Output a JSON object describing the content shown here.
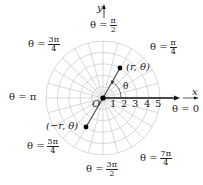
{
  "diagram": {
    "type": "polar-grid",
    "center": {
      "x": 103,
      "y": 98
    },
    "ring_count": 5,
    "ring_spacing": 11.4,
    "spoke_count": 24,
    "axis_x_label": "x",
    "axis_y_label": "y",
    "origin_label": "O",
    "radial_ticks": [
      "1",
      "2",
      "3",
      "4",
      "5"
    ],
    "angle_symbol": "θ",
    "point_positive": {
      "label": "(r, θ)"
    },
    "point_negative": {
      "label": "(−r, θ)"
    },
    "angle_labels": {
      "zero": "θ = 0",
      "pi": "θ = π",
      "pi_over_2": {
        "prefix": "θ =",
        "num": "π",
        "den": "2"
      },
      "pi_over_4": {
        "prefix": "θ =",
        "num": "π",
        "den": "4"
      },
      "three_pi_over_4": {
        "prefix": "θ =",
        "num": "3π",
        "den": "4"
      },
      "five_pi_over_4": {
        "prefix": "θ =",
        "num": "5π",
        "den": "4"
      },
      "three_pi_over_2": {
        "prefix": "θ =",
        "num": "3π",
        "den": "2"
      },
      "seven_pi_over_4": {
        "prefix": "θ =",
        "num": "7π",
        "den": "4"
      }
    },
    "colors": {
      "grid": "#c8c8c8",
      "axis": "#111111",
      "line": "#555555",
      "point": "#000000",
      "text": "#222222"
    }
  }
}
